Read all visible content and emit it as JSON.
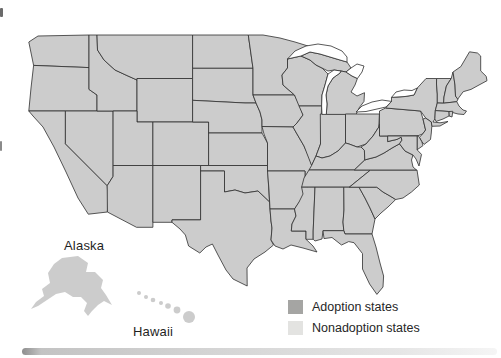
{
  "figure": {
    "labels": {
      "alaska": "Alaska",
      "hawaii": "Hawaii"
    },
    "legend": {
      "items": [
        {
          "label": "Adoption states",
          "status": "adoption"
        },
        {
          "label": "Nonadoption states",
          "status": "nonadoption"
        }
      ]
    },
    "colors": {
      "adoption": "#a5a5a3",
      "nonadoption": "#e3e3e1",
      "border": "#2f2f2f",
      "water": "#ffffff",
      "text": "#1f1f1f"
    },
    "states": [
      {
        "id": "WA",
        "name": "Washington",
        "status": "nonadoption"
      },
      {
        "id": "OR",
        "name": "Oregon",
        "status": "adoption"
      },
      {
        "id": "CA",
        "name": "California",
        "status": "adoption"
      },
      {
        "id": "ID",
        "name": "Idaho",
        "status": "adoption"
      },
      {
        "id": "NV",
        "name": "Nevada",
        "status": "adoption"
      },
      {
        "id": "UT",
        "name": "Utah",
        "status": "adoption"
      },
      {
        "id": "AZ",
        "name": "Arizona",
        "status": "nonadoption"
      },
      {
        "id": "MT",
        "name": "Montana",
        "status": "nonadoption"
      },
      {
        "id": "WY",
        "name": "Wyoming",
        "status": "nonadoption"
      },
      {
        "id": "CO",
        "name": "Colorado",
        "status": "nonadoption"
      },
      {
        "id": "NM",
        "name": "New Mexico",
        "status": "adoption"
      },
      {
        "id": "TX",
        "name": "Texas",
        "status": "adoption"
      },
      {
        "id": "OK",
        "name": "Oklahoma",
        "status": "adoption"
      },
      {
        "id": "KS",
        "name": "Kansas",
        "status": "nonadoption"
      },
      {
        "id": "NE",
        "name": "Nebraska",
        "status": "nonadoption"
      },
      {
        "id": "SD",
        "name": "South Dakota",
        "status": "nonadoption"
      },
      {
        "id": "ND",
        "name": "North Dakota",
        "status": "nonadoption"
      },
      {
        "id": "MN",
        "name": "Minnesota",
        "status": "nonadoption"
      },
      {
        "id": "IA",
        "name": "Iowa",
        "status": "nonadoption"
      },
      {
        "id": "MO",
        "name": "Missouri",
        "status": "nonadoption"
      },
      {
        "id": "AR",
        "name": "Arkansas",
        "status": "adoption"
      },
      {
        "id": "LA",
        "name": "Louisiana",
        "status": "adoption"
      },
      {
        "id": "WI",
        "name": "Wisconsin",
        "status": "nonadoption"
      },
      {
        "id": "IL",
        "name": "Illinois",
        "status": "adoption"
      },
      {
        "id": "IN",
        "name": "Indiana",
        "status": "adoption"
      },
      {
        "id": "MI",
        "name": "Michigan",
        "status": "nonadoption"
      },
      {
        "id": "OH",
        "name": "Ohio",
        "status": "nonadoption"
      },
      {
        "id": "KY",
        "name": "Kentucky",
        "status": "adoption"
      },
      {
        "id": "TN",
        "name": "Tennessee",
        "status": "adoption"
      },
      {
        "id": "MS",
        "name": "Mississippi",
        "status": "adoption"
      },
      {
        "id": "AL",
        "name": "Alabama",
        "status": "adoption"
      },
      {
        "id": "GA",
        "name": "Georgia",
        "status": "adoption"
      },
      {
        "id": "FL",
        "name": "Florida",
        "status": "adoption"
      },
      {
        "id": "SC",
        "name": "South Carolina",
        "status": "adoption"
      },
      {
        "id": "NC",
        "name": "North Carolina",
        "status": "adoption"
      },
      {
        "id": "VA",
        "name": "Virginia",
        "status": "adoption"
      },
      {
        "id": "WV",
        "name": "West Virginia",
        "status": "adoption"
      },
      {
        "id": "PA",
        "name": "Pennsylvania",
        "status": "nonadoption"
      },
      {
        "id": "NY",
        "name": "New York",
        "status": "nonadoption"
      },
      {
        "id": "VT",
        "name": "Vermont",
        "status": "nonadoption"
      },
      {
        "id": "NH",
        "name": "New Hampshire",
        "status": "nonadoption"
      },
      {
        "id": "ME",
        "name": "Maine",
        "status": "nonadoption"
      },
      {
        "id": "MA",
        "name": "Massachusetts",
        "status": "nonadoption"
      },
      {
        "id": "RI",
        "name": "Rhode Island",
        "status": "nonadoption"
      },
      {
        "id": "CT",
        "name": "Connecticut",
        "status": "nonadoption"
      },
      {
        "id": "NJ",
        "name": "New Jersey",
        "status": "nonadoption"
      },
      {
        "id": "DE",
        "name": "Delaware",
        "status": "nonadoption"
      },
      {
        "id": "MD",
        "name": "Maryland",
        "status": "nonadoption"
      },
      {
        "id": "AK",
        "name": "Alaska",
        "status": "nonadoption"
      },
      {
        "id": "HI",
        "name": "Hawaii",
        "status": "nonadoption"
      }
    ]
  }
}
